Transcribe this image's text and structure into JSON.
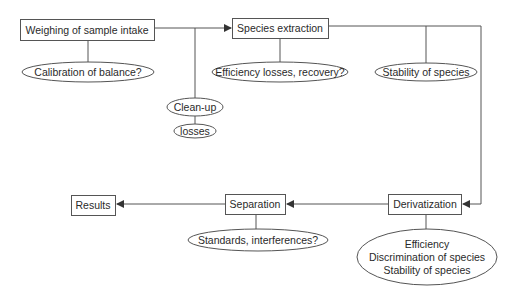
{
  "diagram": {
    "colors": {
      "stroke": "#555555",
      "text": "#2a2a2a",
      "background": "#ffffff"
    },
    "process_steps": [
      {
        "id": "weighing",
        "label": "Weighing of sample intake"
      },
      {
        "id": "extraction",
        "label": "Species extraction"
      },
      {
        "id": "derivatization",
        "label": "Derivatization"
      },
      {
        "id": "separation",
        "label": "Separation"
      },
      {
        "id": "results",
        "label": "Results"
      }
    ],
    "error_sources": [
      {
        "id": "calibration",
        "attached_to": "weighing",
        "label": "Calibration of balance?"
      },
      {
        "id": "cleanup",
        "attached_to": "weighing-extraction link",
        "label": "Clean-up"
      },
      {
        "id": "cleanup-losses",
        "attached_to": "cleanup",
        "label": "losses"
      },
      {
        "id": "efficiency-losses",
        "attached_to": "extraction",
        "label": "Efficiency losses, recovery?"
      },
      {
        "id": "stability",
        "attached_to": "extraction-derivatization link",
        "label": "Stability of species"
      },
      {
        "id": "standards",
        "attached_to": "separation",
        "label": "Standards, interferences?"
      },
      {
        "id": "derivatization-issues",
        "attached_to": "derivatization",
        "lines": [
          "Efficiency",
          "Discrimination of species",
          "Stability of species"
        ]
      }
    ]
  }
}
